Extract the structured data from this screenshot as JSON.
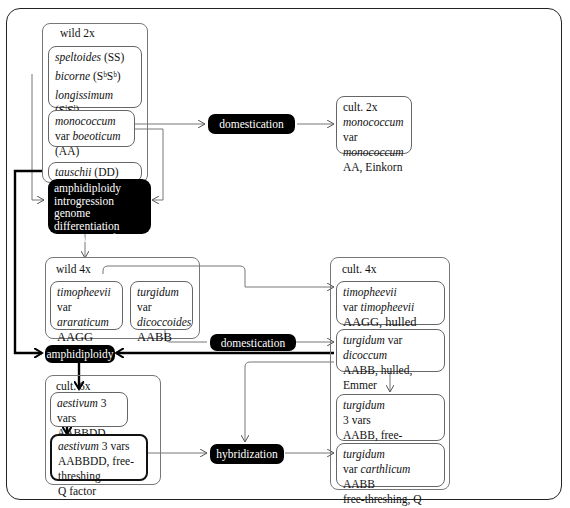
{
  "diagram": {
    "groups": {
      "wild2x": {
        "title": "wild 2x",
        "species_group": {
          "lines": [
            {
              "name": "speltoides",
              "genome": "(SS)"
            },
            {
              "name": "bicorne",
              "genome": "(SᵇSᵇ)"
            },
            {
              "name": "longissimum",
              "genome": "(SˡSˡ)"
            }
          ]
        },
        "monococcum": {
          "name": "monococcum",
          "var": "var",
          "var_name": "boeoticum",
          "genome": "(AA)"
        },
        "tauschii": {
          "name": "tauschii",
          "genome": "(DD)"
        }
      },
      "cult2x": {
        "title": "cult. 2x",
        "name": "monococcum",
        "var": "var",
        "var_name": "monococcum",
        "genome": "AA, Einkorn"
      },
      "process_block": {
        "lines": [
          "amphidiploidy",
          "introgression",
          "genome differentiation",
          "via AA SˣSˣ forms"
        ]
      },
      "wild4x": {
        "title": "wild 4x",
        "timopheevii": {
          "name": "timopheevii",
          "var": "var",
          "var_name": "araraticum",
          "genome": "AAGG"
        },
        "turgidum": {
          "name": "turgidum",
          "var": "var",
          "var_name": "dicoccoides",
          "genome": "AABB"
        }
      },
      "cult4x": {
        "title": "cult. 4x",
        "timopheevii": {
          "name": "timopheevii",
          "var": "var",
          "var_name": "timopheevii",
          "genome": "AAGG, hulled"
        },
        "dicoccum": {
          "name": "turgidum",
          "var": "var",
          "var_name": "dicoccum",
          "genome": "AABB, hulled, Emmer"
        },
        "turgidum3": {
          "name": "turgidum",
          "vars": "3 vars",
          "genome": "AABB, free-threshing"
        },
        "carthlicum": {
          "name": "turgidum",
          "var": "var",
          "var_name": "carthlicum",
          "genome_inline": "AABB",
          "traits": "free-threshing, Q factor"
        }
      },
      "cult6x": {
        "title": "cult. 6x",
        "hulled": {
          "name": "aestivum",
          "vars": "3 vars",
          "genome": "AABBDD, hulled"
        },
        "freethreshing": {
          "name": "aestivum",
          "vars": "3 vars",
          "genome": "AABBDD, free-threshing",
          "traits": "Q factor"
        }
      }
    },
    "processes": {
      "domestication_top": "domestication",
      "domestication_mid": "domestication",
      "amphidiploidy": "amphidiploidy",
      "hybridization": "hybridization"
    }
  }
}
